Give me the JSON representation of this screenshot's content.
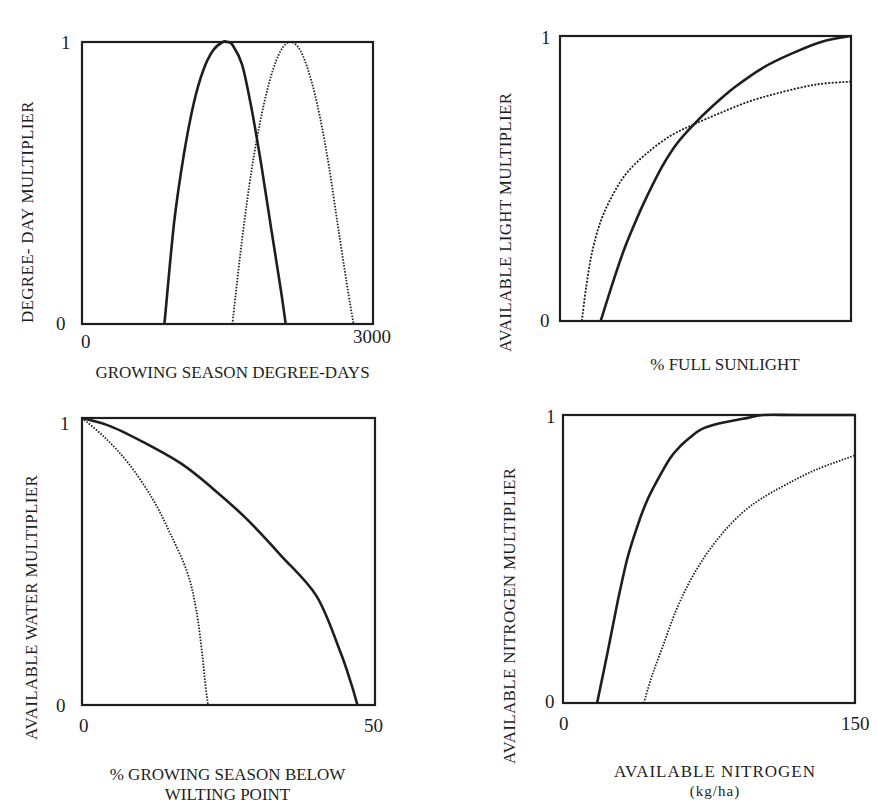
{
  "chart_data": [
    {
      "type": "line",
      "id": "degree-day",
      "title": "",
      "xlabel": "GROWING SEASON DEGREE-DAYS",
      "ylabel": "DEGREE- DAY MULTIPLIER",
      "xlim": [
        0,
        3000
      ],
      "ylim": [
        0,
        1
      ],
      "x_ticks": [
        "0",
        "3000"
      ],
      "y_ticks": [
        "0",
        "1"
      ],
      "grid": false,
      "legend": null,
      "series": [
        {
          "name": "solid",
          "style": "solid",
          "x": [
            850,
            950,
            1050,
            1150,
            1250,
            1350,
            1450,
            1500,
            1550,
            1650,
            1750,
            1850,
            1950,
            2050,
            2100
          ],
          "y": [
            0.0,
            0.36,
            0.6,
            0.78,
            0.9,
            0.97,
            1.0,
            1.0,
            0.99,
            0.92,
            0.76,
            0.56,
            0.34,
            0.12,
            0.0
          ]
        },
        {
          "name": "dotted",
          "style": "dotted",
          "x": [
            1550,
            1650,
            1750,
            1850,
            1950,
            2050,
            2150,
            2250,
            2350,
            2450,
            2550,
            2650,
            2750,
            2800
          ],
          "y": [
            0.0,
            0.3,
            0.55,
            0.74,
            0.88,
            0.97,
            1.0,
            0.97,
            0.88,
            0.74,
            0.55,
            0.32,
            0.1,
            0.0
          ]
        }
      ]
    },
    {
      "type": "line",
      "id": "light",
      "title": "",
      "xlabel": "%  FULL SUNLIGHT",
      "ylabel": "AVAILABLE LIGHT MULTIPLIER",
      "xlim": [
        0,
        100
      ],
      "ylim": [
        0,
        1
      ],
      "x_ticks": [],
      "y_ticks": [
        "0",
        "1"
      ],
      "grid": false,
      "legend": null,
      "series": [
        {
          "name": "solid",
          "style": "solid",
          "x": [
            14,
            18,
            22,
            26,
            30,
            35,
            40,
            46,
            52,
            60,
            70,
            80,
            90,
            100
          ],
          "y": [
            0.0,
            0.13,
            0.25,
            0.35,
            0.44,
            0.54,
            0.62,
            0.69,
            0.75,
            0.82,
            0.89,
            0.94,
            0.98,
            1.0
          ]
        },
        {
          "name": "dotted",
          "style": "dashed",
          "x": [
            7.5,
            9,
            11,
            14,
            18,
            23,
            30,
            38,
            46,
            55,
            65,
            75,
            88,
            100
          ],
          "y": [
            0.0,
            0.12,
            0.24,
            0.35,
            0.44,
            0.52,
            0.59,
            0.65,
            0.69,
            0.73,
            0.77,
            0.8,
            0.83,
            0.84
          ]
        }
      ]
    },
    {
      "type": "line",
      "id": "water",
      "title": "",
      "xlabel": "% GROWING SEASON BELOW",
      "xlabel_line2": "WILTING POINT",
      "ylabel": "AVAILABLE WATER MULTIPLIER",
      "xlim": [
        0,
        50
      ],
      "ylim": [
        0,
        1
      ],
      "x_ticks": [
        "0",
        "50"
      ],
      "y_ticks": [
        "0",
        "1"
      ],
      "grid": false,
      "legend": null,
      "series": [
        {
          "name": "solid",
          "style": "solid",
          "x": [
            0,
            5,
            11,
            17,
            22,
            28,
            34,
            40,
            44,
            46,
            47
          ],
          "y": [
            1.0,
            0.97,
            0.91,
            0.84,
            0.76,
            0.65,
            0.52,
            0.38,
            0.19,
            0.07,
            0.0
          ]
        },
        {
          "name": "dotted",
          "style": "dotted",
          "x": [
            0,
            4,
            8,
            12,
            15,
            18,
            19.5,
            20.5,
            21,
            21.5
          ],
          "y": [
            1.0,
            0.93,
            0.84,
            0.72,
            0.6,
            0.46,
            0.33,
            0.18,
            0.08,
            0.0
          ]
        }
      ]
    },
    {
      "type": "line",
      "id": "nitrogen",
      "title": "",
      "xlabel": "AVAILABLE NITROGEN",
      "xlabel_line2": "(kg/ha)",
      "ylabel": "AVAILABLE NITROGEN MULTIPLIER",
      "xlim": [
        0,
        150
      ],
      "ylim": [
        0,
        1
      ],
      "x_ticks": [
        "0",
        "150"
      ],
      "y_ticks": [
        "0",
        "1"
      ],
      "grid": false,
      "legend": null,
      "series": [
        {
          "name": "solid",
          "style": "solid",
          "x": [
            17.5,
            23,
            28,
            33,
            38,
            43,
            49,
            55,
            60,
            65,
            71,
            80,
            95,
            103,
            120,
            150
          ],
          "y": [
            0.0,
            0.18,
            0.35,
            0.5,
            0.61,
            0.7,
            0.78,
            0.85,
            0.89,
            0.92,
            0.95,
            0.97,
            0.99,
            1.0,
            1.0,
            1.0
          ]
        },
        {
          "name": "dotted",
          "style": "dotted",
          "x": [
            41.5,
            46,
            52,
            58,
            65,
            73,
            82,
            92,
            102,
            115,
            130,
            150
          ],
          "y": [
            0.0,
            0.1,
            0.21,
            0.32,
            0.42,
            0.51,
            0.59,
            0.66,
            0.71,
            0.76,
            0.81,
            0.86
          ]
        }
      ]
    }
  ],
  "panels": [
    {
      "ylabel": "DEGREE- DAY MULTIPLIER",
      "y1": "1",
      "y0": "0",
      "x0": "0",
      "x1": "3000",
      "xlabel": "GROWING SEASON DEGREE-DAYS",
      "xlabel2": ""
    },
    {
      "ylabel": "AVAILABLE LIGHT MULTIPLIER",
      "y1": "1",
      "y0": "0",
      "x0": "",
      "x1": "",
      "xlabel": "%  FULL SUNLIGHT",
      "xlabel2": ""
    },
    {
      "ylabel": "AVAILABLE WATER MULTIPLIER",
      "y1": "1",
      "y0": "0",
      "x0": "0",
      "x1": "50",
      "xlabel": "% GROWING SEASON BELOW",
      "xlabel2": "WILTING POINT"
    },
    {
      "ylabel": "AVAILABLE NITROGEN MULTIPLIER",
      "y1": "1",
      "y0": "0",
      "x0": "0",
      "x1": "150",
      "xlabel": "AVAILABLE NITROGEN",
      "xlabel2": "(kg/ha)"
    }
  ],
  "colors": {
    "ink": "#1e1e1e",
    "background": "#ffffff"
  }
}
